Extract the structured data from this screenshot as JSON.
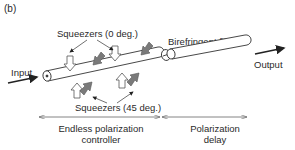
{
  "figure": {
    "panel_label": "(b)",
    "labels": {
      "squeezers_0": "Squeezers (0 deg.)",
      "squeezers_45": "Squeezers (45 deg.)",
      "birefringent_fiber": "Birefringent fiber",
      "input": "Input",
      "output": "Output",
      "controller_line1": "Endless polarization",
      "controller_line2": "controller",
      "delay_line1": "Polarization",
      "delay_line2": "delay"
    },
    "colors": {
      "line": "#333333",
      "squeezer_0_fill": "#ffffff",
      "squeezer_45_fill": "#7a7a7a",
      "dim_line": "#666666"
    }
  }
}
